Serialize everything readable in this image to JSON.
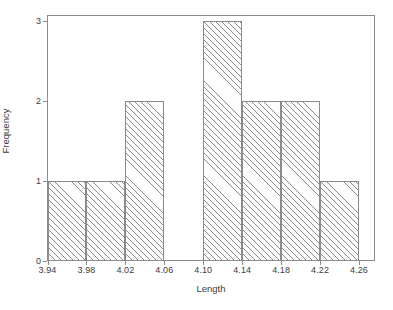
{
  "chart_data": {
    "type": "bar",
    "title": "",
    "subtitle": "",
    "xlabel": "Length",
    "ylabel": "Frequency",
    "xlim": [
      3.92,
      4.28
    ],
    "ylim": [
      0,
      3
    ],
    "grid": false,
    "legend": null,
    "bin_width": 0.04,
    "bin_edges": [
      3.94,
      3.98,
      4.02,
      4.06,
      4.1,
      4.14,
      4.18,
      4.22,
      4.26
    ],
    "categories": [
      "3.94-3.98",
      "3.98-4.02",
      "4.02-4.06",
      "4.06-4.10",
      "4.10-4.14",
      "4.14-4.18",
      "4.18-4.22",
      "4.22-4.26"
    ],
    "values": [
      1,
      1,
      2,
      0,
      3,
      2,
      2,
      1
    ],
    "total_count": 12,
    "xticks": [
      3.94,
      3.98,
      4.02,
      4.06,
      4.1,
      4.14,
      4.18,
      4.22,
      4.26
    ],
    "xtick_labels": [
      "3.94",
      "3.98",
      "4.02",
      "4.06",
      "4.10",
      "4.14",
      "4.18",
      "4.22",
      "4.26"
    ],
    "yticks": [
      0,
      1,
      2,
      3
    ],
    "ytick_labels": [
      "0",
      "1",
      "2",
      "3"
    ],
    "bar_fill": "#fdfdfd",
    "bar_edge_color": "#8b8b8b",
    "bar_hatch": "/",
    "frame_color": "#8b8b8b",
    "background": "#ffffff",
    "text_color": "#3c3c3c"
  }
}
